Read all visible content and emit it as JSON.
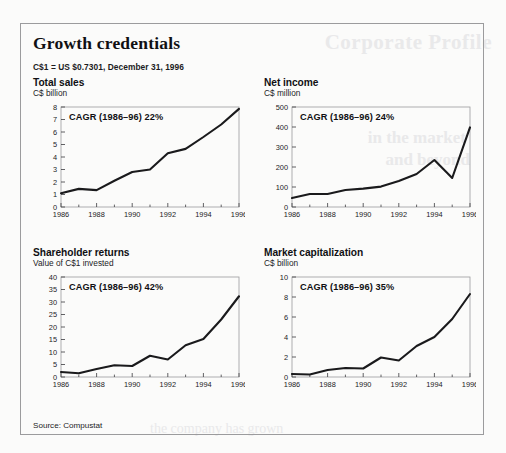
{
  "panel": {
    "title": "Growth credentials",
    "fx_note": "C$1 = US $0.7301, December 31, 1996",
    "source": "Source: Compustat",
    "border_color": "#9b9b9d",
    "line_color": "#1a1a1c"
  },
  "ghost_text": {
    "g1": "Corporate Profile",
    "g2": "in the market",
    "g3": "and beyond",
    "g4": "the company has grown"
  },
  "chart_data": [
    {
      "id": "total-sales",
      "type": "line",
      "title": "Total sales",
      "subtitle": "C$ billion",
      "ylabel": "C$ billion",
      "xlabel": "",
      "annotation": "CAGR (1986–96) 22%",
      "cagr_percent": 22,
      "x": [
        1986,
        1987,
        1988,
        1989,
        1990,
        1991,
        1992,
        1993,
        1994,
        1995,
        1996
      ],
      "values": [
        1.1,
        1.45,
        1.35,
        2.1,
        2.8,
        3.0,
        4.3,
        4.65,
        5.6,
        6.6,
        7.85
      ],
      "ylim": [
        0,
        8
      ],
      "yticks": [
        0,
        1,
        2,
        3,
        4,
        5,
        6,
        7,
        8
      ],
      "xticks": [
        1986,
        1988,
        1990,
        1992,
        1994,
        1996
      ],
      "xtick_labels": [
        "1986",
        "1988",
        "1990",
        "1992",
        "1994",
        "1996"
      ],
      "grid": false,
      "legend": "none"
    },
    {
      "id": "net-income",
      "type": "line",
      "title": "Net income",
      "subtitle": "C$ million",
      "ylabel": "C$ million",
      "xlabel": "",
      "annotation": "CAGR (1986–96) 24%",
      "cagr_percent": 24,
      "x": [
        1986,
        1987,
        1988,
        1989,
        1990,
        1991,
        1992,
        1993,
        1994,
        1995,
        1996
      ],
      "values": [
        45,
        65,
        65,
        85,
        92,
        102,
        130,
        165,
        235,
        145,
        398
      ],
      "ylim": [
        0,
        500
      ],
      "yticks": [
        0,
        100,
        200,
        300,
        400,
        500
      ],
      "xticks": [
        1986,
        1988,
        1990,
        1992,
        1994,
        1996
      ],
      "xtick_labels": [
        "1986",
        "1988",
        "1990",
        "1992",
        "1994",
        "1996"
      ],
      "grid": false,
      "legend": "none"
    },
    {
      "id": "shareholder-returns",
      "type": "line",
      "title": "Shareholder returns",
      "subtitle": "Value of C$1 invested",
      "ylabel": "Value of C$1 invested",
      "xlabel": "",
      "annotation": "CAGR (1986–96) 42%",
      "cagr_percent": 42,
      "x": [
        1986,
        1987,
        1988,
        1989,
        1990,
        1991,
        1992,
        1993,
        1994,
        1995,
        1996
      ],
      "values": [
        2.0,
        1.5,
        3.2,
        4.7,
        4.4,
        8.5,
        7.0,
        12.7,
        15.2,
        23.0,
        32.3
      ],
      "ylim": [
        0,
        40
      ],
      "yticks": [
        0,
        5,
        10,
        15,
        20,
        25,
        30,
        35,
        40
      ],
      "xticks": [
        1986,
        1988,
        1990,
        1992,
        1994,
        1996
      ],
      "xtick_labels": [
        "1986",
        "1988",
        "1990",
        "1992",
        "1994",
        "1996"
      ],
      "grid": false,
      "legend": "none"
    },
    {
      "id": "market-capitalization",
      "type": "line",
      "title": "Market capitalization",
      "subtitle": "C$ billion",
      "ylabel": "C$ billion",
      "xlabel": "",
      "annotation": "CAGR (1986–96) 35%",
      "cagr_percent": 35,
      "x": [
        1986,
        1987,
        1988,
        1989,
        1990,
        1991,
        1992,
        1993,
        1994,
        1995,
        1996
      ],
      "values": [
        0.3,
        0.25,
        0.7,
        0.9,
        0.85,
        1.95,
        1.65,
        3.1,
        4.0,
        5.8,
        8.3
      ],
      "ylim": [
        0,
        10
      ],
      "yticks": [
        0,
        2,
        4,
        6,
        8,
        10
      ],
      "xticks": [
        1986,
        1988,
        1990,
        1992,
        1994,
        1996
      ],
      "xtick_labels": [
        "1986",
        "1988",
        "1990",
        "1992",
        "1994",
        "1996"
      ],
      "grid": false,
      "legend": "none"
    }
  ]
}
